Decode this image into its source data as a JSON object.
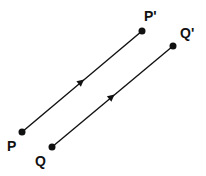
{
  "diagram": {
    "colors": {
      "ink": "#111111",
      "background": "#ffffff"
    },
    "segments": [
      {
        "id": "PP",
        "from": "P",
        "to": "P'",
        "direction_arrow": true
      },
      {
        "id": "QQ",
        "from": "Q",
        "to": "Q'",
        "direction_arrow": true
      }
    ],
    "points": [
      {
        "id": "P",
        "label": "P"
      },
      {
        "id": "P'",
        "label": "P'"
      },
      {
        "id": "Q",
        "label": "Q"
      },
      {
        "id": "Q'",
        "label": "Q'"
      }
    ]
  }
}
